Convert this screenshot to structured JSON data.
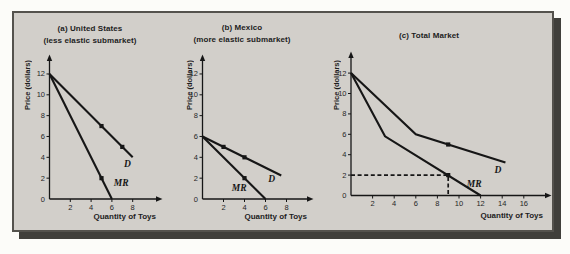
{
  "figure": {
    "panel_bg": "#d2cfca",
    "page_bg": "#fcfcf9",
    "border_color": "#54524d",
    "shadow_color": "#403f3b",
    "line_color": "#161616",
    "text_color": "#1d1d1d"
  },
  "chart_data": [
    {
      "type": "line",
      "panel": "a",
      "title": "(a) United States",
      "subtitle": "(less elastic submarket)",
      "xlabel": "Quantity of Toys",
      "ylabel": "Price (dollars)",
      "x_ticks": [
        2,
        4,
        6,
        8
      ],
      "y_ticks": [
        0,
        2,
        4,
        6,
        8,
        10,
        12
      ],
      "xlim": [
        0,
        10.3
      ],
      "ylim": [
        0,
        13.5
      ],
      "grid": "off",
      "series": [
        {
          "name": "demand",
          "label": "D",
          "points": [
            [
              0,
              12
            ],
            [
              8,
              4
            ]
          ],
          "label_at": [
            7.5,
            3.4
          ]
        },
        {
          "name": "marginal-revenue",
          "label": "MR",
          "points": [
            [
              0,
              12
            ],
            [
              6,
              0
            ]
          ],
          "label_at": [
            6.9,
            1.5
          ]
        }
      ],
      "markers": [
        [
          5,
          7
        ],
        [
          7,
          5
        ],
        [
          5,
          2
        ]
      ],
      "guides": []
    },
    {
      "type": "line",
      "panel": "b",
      "title": "(b) Mexico",
      "subtitle": "(more elastic submarket)",
      "xlabel": "Quantity of Toys",
      "ylabel": "Price (dollars)",
      "x_ticks": [
        2,
        4,
        6,
        8
      ],
      "y_ticks": [
        0,
        2,
        4,
        6,
        8,
        10,
        12
      ],
      "xlim": [
        0,
        10
      ],
      "ylim": [
        0,
        13.5
      ],
      "grid": "off",
      "series": [
        {
          "name": "demand",
          "label": "D",
          "points": [
            [
              0,
              6
            ],
            [
              7.5,
              2.25
            ]
          ],
          "label_at": [
            6.6,
            1.9
          ]
        },
        {
          "name": "marginal-revenue",
          "label": "MR",
          "points": [
            [
              0,
              6
            ],
            [
              6,
              0
            ]
          ],
          "label_at": [
            3.5,
            1.1
          ]
        }
      ],
      "markers": [
        [
          2,
          5
        ],
        [
          4,
          4
        ],
        [
          4,
          2
        ]
      ],
      "guides": []
    },
    {
      "type": "line",
      "panel": "c",
      "title": "(c) Total Market",
      "subtitle": "",
      "xlabel": "Quantity of Toys",
      "ylabel": "Price (dollars)",
      "x_ticks": [
        2,
        4,
        6,
        8,
        10,
        12,
        14,
        16
      ],
      "y_ticks": [
        0,
        2,
        4,
        6,
        8,
        10,
        12
      ],
      "xlim": [
        0,
        18
      ],
      "ylim": [
        0,
        13.5
      ],
      "grid": "off",
      "series": [
        {
          "name": "demand",
          "label": "D",
          "points": [
            [
              0,
              12
            ],
            [
              6,
              6
            ],
            [
              14.3,
              3.23
            ]
          ],
          "label_at": [
            13.6,
            2.5
          ]
        },
        {
          "name": "marginal-revenue",
          "label": "MR",
          "points": [
            [
              0,
              12
            ],
            [
              3.15,
              5.8
            ],
            [
              12,
              0
            ]
          ],
          "label_at": [
            11.4,
            1.1
          ]
        }
      ],
      "markers": [
        [
          9,
          5
        ],
        [
          9,
          2
        ]
      ],
      "guides": [
        {
          "style": "dashed",
          "meaning": "price 2 at quantity 9",
          "points": [
            [
              0,
              2
            ],
            [
              9,
              2
            ],
            [
              9,
              0
            ]
          ]
        }
      ]
    }
  ]
}
